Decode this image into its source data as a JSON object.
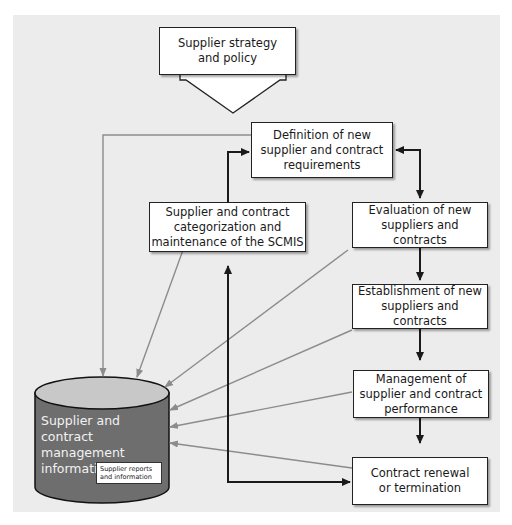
{
  "diagram": {
    "title_box": {
      "label": "Supplier strategy\nand policy"
    },
    "nodes": {
      "definition": {
        "label": "Definition of new\nsupplier and contract\nrequirements"
      },
      "categorization": {
        "label": "Supplier and contract\ncategorization and\nmaintenance of the SCMIS"
      },
      "evaluation": {
        "label": "Evaluation of new\nsuppliers and contracts"
      },
      "establishment": {
        "label": "Establishment of new\nsuppliers and contracts"
      },
      "management": {
        "label": "Management of\nsupplier and contract\nperformance"
      },
      "renewal": {
        "label": "Contract renewal\nor termination"
      }
    },
    "database": {
      "label": "Supplier and contract\nmanagement\ninformation system",
      "sub_label": "Supplier reports\nand information"
    },
    "colors": {
      "panel_bg": "#ececec",
      "box_fill": "#ffffff",
      "flow_arrow": "#1a1a1a",
      "info_arrow": "#8c8c8c",
      "db_body": "#6e6e6e",
      "db_top": "#c8c8c8"
    }
  }
}
